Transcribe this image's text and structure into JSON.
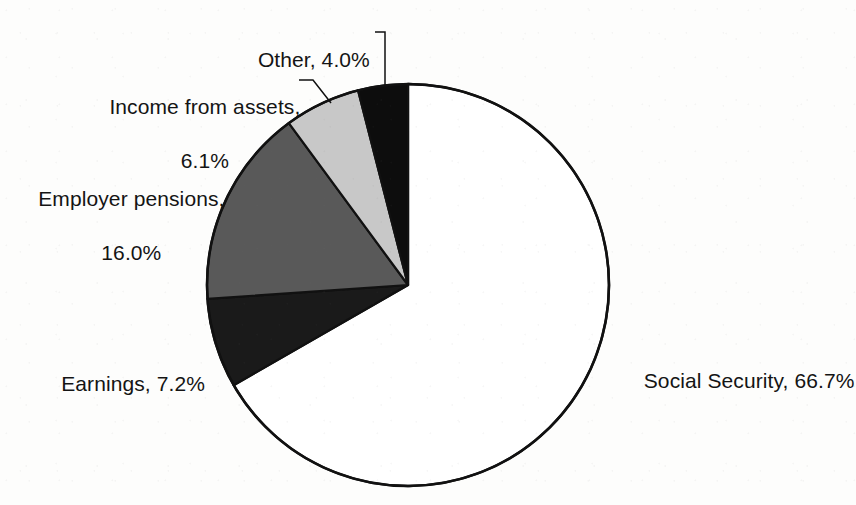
{
  "chart_data": {
    "type": "pie",
    "title": "",
    "subtitle": "",
    "xlabel": "",
    "ylabel": "",
    "legend_position": "none",
    "grid": false,
    "units": "percent",
    "total": 100.0,
    "start_angle_deg": 0,
    "direction": "clockwise",
    "categories": [
      "Social Security",
      "Earnings",
      "Employer pensions",
      "Income from assets",
      "Other"
    ],
    "values": [
      66.7,
      7.2,
      16.0,
      6.1,
      4.0
    ],
    "slices": [
      {
        "name": "Social Security",
        "value": 66.7,
        "value_text": "66.7%",
        "label": "Social Security, 66.7%",
        "color": "#ffffff",
        "stroke": "#111111",
        "has_leader": false
      },
      {
        "name": "Earnings",
        "value": 7.2,
        "value_text": "7.2%",
        "label": "Earnings, 7.2%",
        "color": "#1a1a1a",
        "stroke": "#111111",
        "has_leader": false
      },
      {
        "name": "Employer pensions",
        "value": 16.0,
        "value_text": "16.0%",
        "label_line1": "Employer pensions,",
        "label_line2": "16.0%",
        "color": "#595959",
        "stroke": "#111111",
        "has_leader": false
      },
      {
        "name": "Income from assets",
        "value": 6.1,
        "value_text": "6.1%",
        "label_line1": "Income from assets,",
        "label_line2": "6.1%",
        "color": "#c8c8c8",
        "stroke": "#111111",
        "has_leader": true
      },
      {
        "name": "Other",
        "value": 4.0,
        "value_text": "4.0%",
        "label": "Other, 4.0%",
        "color": "#0d0d0d",
        "stroke": "#111111",
        "has_leader": true
      }
    ]
  },
  "geometry": {
    "center_x": 408,
    "center_y": 285,
    "radius": 201
  },
  "labels": {
    "other": "Other, 4.0%",
    "income_from_assets_line1": "Income from assets,",
    "income_from_assets_line2": "6.1%",
    "employer_pensions_line1": "Employer pensions,",
    "employer_pensions_line2": "16.0%",
    "earnings": "Earnings, 7.2%",
    "social_security": "Social Security, 66.7%"
  },
  "colors": {
    "background": "#fdfdfc",
    "outline": "#111111",
    "text": "#141414",
    "social_security": "#ffffff",
    "earnings": "#1a1a1a",
    "employer_pensions": "#595959",
    "income_from_assets": "#c8c8c8",
    "other": "#0d0d0d"
  }
}
